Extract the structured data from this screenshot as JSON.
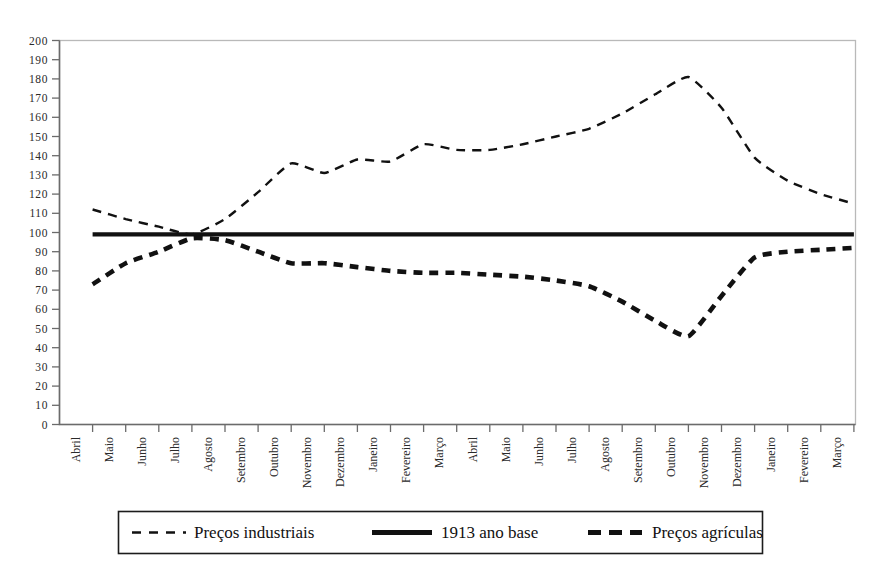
{
  "figure": {
    "title_faint": "",
    "background": "#ffffff",
    "ink_color": "#111111",
    "frame_color": "#b9b9b9"
  },
  "legend": {
    "position": "bottom",
    "entries": [
      {
        "label": "Preços industriais",
        "style": "dashed-fine",
        "color": "#111111"
      },
      {
        "label": "1913 ano base",
        "style": "solid-thick",
        "color": "#111111"
      },
      {
        "label": "Preços agrículas",
        "style": "dashed-thick",
        "color": "#111111"
      }
    ]
  },
  "chart_data": {
    "type": "line",
    "title": "",
    "xlabel": "",
    "ylabel": "",
    "ylim": [
      0,
      200
    ],
    "ytick_step": 10,
    "grid": false,
    "legend_position": "bottom",
    "yticks": [
      0,
      10,
      20,
      30,
      40,
      50,
      60,
      70,
      80,
      90,
      100,
      110,
      120,
      130,
      140,
      150,
      160,
      170,
      180,
      190,
      200
    ],
    "ytick_labels": [
      "0",
      "10",
      "20",
      "30",
      "40",
      "50",
      "60",
      "70",
      "80",
      "90",
      "100",
      "110",
      "120",
      "130",
      "140",
      "150",
      "160",
      "170",
      "180",
      "190",
      "200"
    ],
    "categories": [
      "Abril",
      "Maio",
      "Junho",
      "Julho",
      "Agosto",
      "Setembro",
      "Outubro",
      "Novembro",
      "Dezembro",
      "Janeiro",
      "Fevereiro",
      "Março",
      "Abril",
      "Maio",
      "Junho",
      "Julho",
      "Agosto",
      "Setembro",
      "Outubro",
      "Novembro",
      "Dezembro",
      "Janeiro",
      "Fevereiro",
      "Março"
    ],
    "series": [
      {
        "name": "Preços industriais",
        "style": "dashed-fine",
        "values": [
          112,
          107,
          103,
          99,
          107,
          121,
          136,
          131,
          138,
          137,
          146,
          143,
          143,
          146,
          150,
          154,
          162,
          172,
          181,
          165,
          139,
          127,
          120,
          115
        ]
      },
      {
        "name": "1913 ano base",
        "style": "solid-thick",
        "values": [
          99,
          99,
          99,
          99,
          99,
          99,
          99,
          99,
          99,
          99,
          99,
          99,
          99,
          99,
          99,
          99,
          99,
          99,
          99,
          99,
          99,
          99,
          99,
          99
        ]
      },
      {
        "name": "Preços agrículas",
        "style": "dashed-thick",
        "values": [
          73,
          84,
          90,
          97,
          96,
          90,
          84,
          84,
          82,
          80,
          79,
          79,
          78,
          77,
          75,
          72,
          64,
          54,
          46,
          67,
          87,
          90,
          91,
          92
        ]
      }
    ]
  }
}
